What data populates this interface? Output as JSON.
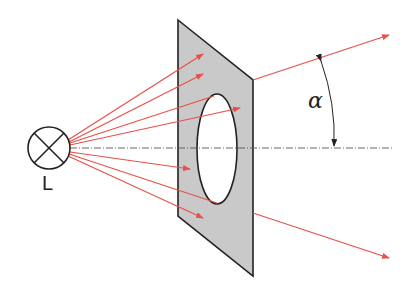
{
  "labels": {
    "lamp": "L",
    "angle": "α"
  },
  "colors": {
    "ray": "#e8504a",
    "plate": "#c8c8c8",
    "outline": "#222222",
    "axis": "#555555"
  },
  "diagram": {
    "elements": [
      "lamp L",
      "opaque plate with elliptical hole",
      "optical axis (dash-dot)",
      "light rays",
      "angle alpha"
    ]
  }
}
